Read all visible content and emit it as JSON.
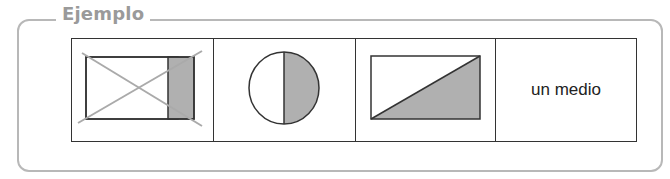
{
  "section": {
    "title": "Ejemplo"
  },
  "table": {
    "cells": [
      {
        "type": "figure",
        "description": "rectangle with a shaded strip, crossed out (incorrect example)",
        "crossed_out": true
      },
      {
        "type": "figure",
        "description": "circle with right half shaded"
      },
      {
        "type": "figure",
        "description": "rectangle divided diagonally, lower-right triangle shaded"
      },
      {
        "type": "text",
        "label": "un medio"
      }
    ]
  },
  "colors": {
    "frame": "#b8b8b8",
    "legend_text": "#9a9a9a",
    "shade": "#b0b0b0",
    "line": "#333333",
    "cross": "#aaaaaa"
  }
}
